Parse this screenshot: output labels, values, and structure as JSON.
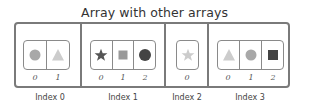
{
  "title": "Array with other arrays",
  "colors": {
    "border": "#7a7a7a",
    "inner_border": "#8a8a8a",
    "light": "#cccccc",
    "medium": "#a8a8a8",
    "mid_square": "#999999",
    "dark": "#4a4a4a"
  },
  "outer_array": [
    {
      "label": "Index 0",
      "inner": [
        {
          "index": "0",
          "shape": "circle-icon",
          "color": "#a8a8a8"
        },
        {
          "index": "1",
          "shape": "triangle-icon",
          "color": "#cccccc"
        }
      ]
    },
    {
      "label": "Index 1",
      "inner": [
        {
          "index": "0",
          "shape": "star-icon",
          "color": "#555555"
        },
        {
          "index": "1",
          "shape": "square-icon",
          "color": "#999999"
        },
        {
          "index": "2",
          "shape": "circle-icon",
          "color": "#444444"
        }
      ]
    },
    {
      "label": "Index 2",
      "inner": [
        {
          "index": "0",
          "shape": "star-icon",
          "color": "#cccccc"
        }
      ]
    },
    {
      "label": "Index 3",
      "inner": [
        {
          "index": "0",
          "shape": "triangle-icon",
          "color": "#cccccc"
        },
        {
          "index": "1",
          "shape": "circle-icon",
          "color": "#a8a8a8"
        },
        {
          "index": "2",
          "shape": "square-icon",
          "color": "#444444"
        }
      ]
    }
  ]
}
